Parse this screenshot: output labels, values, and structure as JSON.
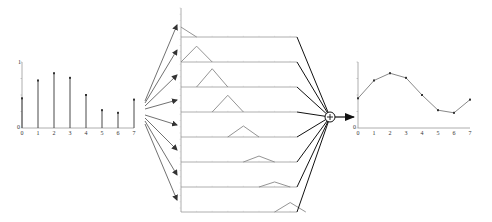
{
  "diagram": {
    "colors": {
      "axis": "#999999",
      "stem": "#333333",
      "basis": "#888888",
      "arrow": "#333333",
      "sum_line": "#111111",
      "output_line": "#888888",
      "point": "#333333"
    },
    "input_plot": {
      "type": "stem",
      "x_labels": [
        "0",
        "1",
        "2",
        "3",
        "4",
        "5",
        "6",
        "7"
      ],
      "y_label_top": "1",
      "y_label_origin": "0",
      "values": [
        0.45,
        0.72,
        0.83,
        0.76,
        0.5,
        0.27,
        0.23,
        0.43
      ]
    },
    "basis_panels": {
      "count": 8,
      "shape": "triangle (hat function)",
      "centers": [
        0,
        1,
        2,
        3,
        4,
        5,
        6,
        7
      ],
      "scaled_heights": [
        0.45,
        0.72,
        0.83,
        0.76,
        0.5,
        0.27,
        0.23,
        0.43
      ]
    },
    "sum_node": {
      "symbol": "+",
      "label": "sum"
    },
    "output_plot": {
      "type": "line",
      "x_labels": [
        "0",
        "1",
        "2",
        "3",
        "4",
        "5",
        "6",
        "7"
      ],
      "y_label_origin": "0",
      "values": [
        0.45,
        0.72,
        0.83,
        0.76,
        0.5,
        0.27,
        0.23,
        0.43
      ]
    }
  }
}
